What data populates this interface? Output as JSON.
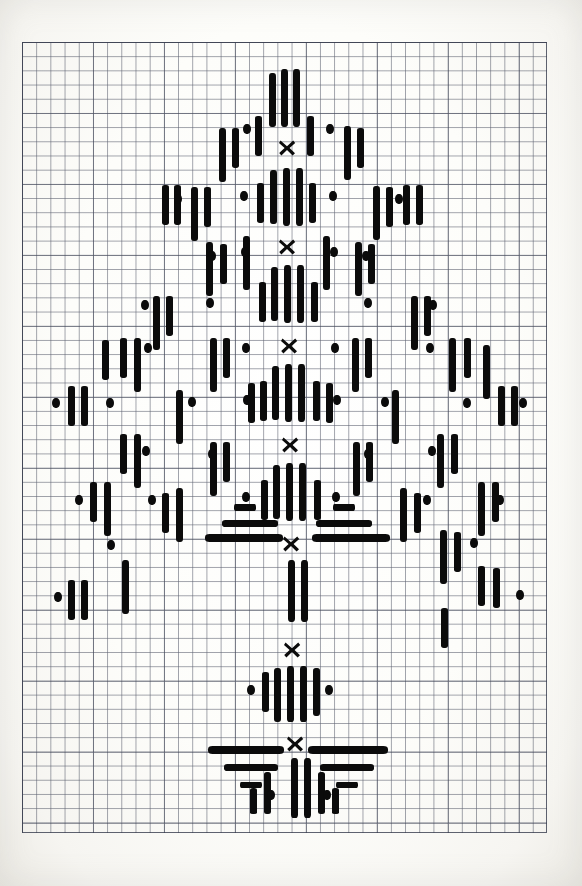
{
  "document": {
    "kind": "hand-drawn needlework chart",
    "title": "Conifer / Christmas tree cross-stitch chart",
    "medium": "ink on graph paper",
    "background_color": "#fdfdfb",
    "ink_color": "#0b0b0b",
    "grid_line_color": "#464b5c",
    "grid_major_color": "#373c4e"
  },
  "grid": {
    "origin_x": 22,
    "origin_y": 42,
    "cell_px": 14.2,
    "columns": 37,
    "rows": 56,
    "major_every": 5,
    "width_px": 525,
    "height_px": 791,
    "visible": true
  },
  "legend": {
    "symbols": [
      {
        "name": "long-vertical-stitch",
        "glyph": "|||",
        "cells": 3,
        "orientation": "vertical"
      },
      {
        "name": "medium-vertical-stitch",
        "glyph": "||",
        "cells": 2,
        "orientation": "vertical"
      },
      {
        "name": "short-vertical-stitch",
        "glyph": "|",
        "cells": 1,
        "orientation": "vertical"
      },
      {
        "name": "dot-stitch",
        "glyph": "•",
        "cells": 0.5,
        "orientation": "point"
      },
      {
        "name": "horizontal-stitch",
        "glyph": "—",
        "orientation": "horizontal"
      },
      {
        "name": "cross-stitch-marker",
        "glyph": "✕",
        "orientation": "cross"
      }
    ]
  },
  "chart_data": {
    "type": "scatter",
    "xlabel": "",
    "ylabel": "",
    "grid": true,
    "legend_position": "none",
    "xlim": [
      0,
      37
    ],
    "ylim": [
      0,
      56
    ],
    "axis_units": "grid cells",
    "center_column": 18.7,
    "crosses": [
      {
        "cx": 287,
        "cy": 148
      },
      {
        "cx": 287,
        "cy": 247
      },
      {
        "cx": 289,
        "cy": 346
      },
      {
        "cx": 290,
        "cy": 445
      },
      {
        "cx": 291,
        "cy": 544
      },
      {
        "cx": 292,
        "cy": 650
      },
      {
        "cx": 295,
        "cy": 744
      }
    ],
    "vertical_bars": [
      {
        "x": 269,
        "y": 73,
        "w": 7,
        "h": 54
      },
      {
        "x": 281,
        "y": 69,
        "w": 7,
        "h": 58
      },
      {
        "x": 293,
        "y": 69,
        "w": 7,
        "h": 58
      },
      {
        "x": 255,
        "y": 116,
        "w": 7,
        "h": 40
      },
      {
        "x": 307,
        "y": 116,
        "w": 7,
        "h": 40
      },
      {
        "x": 219,
        "y": 128,
        "w": 7,
        "h": 54
      },
      {
        "x": 232,
        "y": 128,
        "w": 7,
        "h": 40
      },
      {
        "x": 344,
        "y": 126,
        "w": 7,
        "h": 54
      },
      {
        "x": 357,
        "y": 128,
        "w": 7,
        "h": 40
      },
      {
        "x": 270,
        "y": 170,
        "w": 7,
        "h": 54
      },
      {
        "x": 283,
        "y": 168,
        "w": 7,
        "h": 58
      },
      {
        "x": 296,
        "y": 168,
        "w": 7,
        "h": 58
      },
      {
        "x": 257,
        "y": 183,
        "w": 7,
        "h": 40
      },
      {
        "x": 309,
        "y": 183,
        "w": 7,
        "h": 40
      },
      {
        "x": 191,
        "y": 187,
        "w": 7,
        "h": 54
      },
      {
        "x": 204,
        "y": 187,
        "w": 7,
        "h": 40
      },
      {
        "x": 373,
        "y": 186,
        "w": 7,
        "h": 54
      },
      {
        "x": 386,
        "y": 187,
        "w": 7,
        "h": 40
      },
      {
        "x": 162,
        "y": 185,
        "w": 7,
        "h": 40
      },
      {
        "x": 174,
        "y": 185,
        "w": 7,
        "h": 40
      },
      {
        "x": 403,
        "y": 185,
        "w": 7,
        "h": 40
      },
      {
        "x": 416,
        "y": 185,
        "w": 7,
        "h": 40
      },
      {
        "x": 243,
        "y": 236,
        "w": 7,
        "h": 54
      },
      {
        "x": 323,
        "y": 236,
        "w": 7,
        "h": 54
      },
      {
        "x": 206,
        "y": 242,
        "w": 7,
        "h": 54
      },
      {
        "x": 220,
        "y": 244,
        "w": 7,
        "h": 40
      },
      {
        "x": 355,
        "y": 242,
        "w": 7,
        "h": 54
      },
      {
        "x": 368,
        "y": 244,
        "w": 7,
        "h": 40
      },
      {
        "x": 271,
        "y": 267,
        "w": 7,
        "h": 54
      },
      {
        "x": 284,
        "y": 265,
        "w": 7,
        "h": 58
      },
      {
        "x": 297,
        "y": 265,
        "w": 7,
        "h": 58
      },
      {
        "x": 259,
        "y": 282,
        "w": 7,
        "h": 40
      },
      {
        "x": 311,
        "y": 282,
        "w": 7,
        "h": 40
      },
      {
        "x": 153,
        "y": 296,
        "w": 7,
        "h": 54
      },
      {
        "x": 166,
        "y": 296,
        "w": 7,
        "h": 40
      },
      {
        "x": 411,
        "y": 296,
        "w": 7,
        "h": 54
      },
      {
        "x": 424,
        "y": 296,
        "w": 7,
        "h": 40
      },
      {
        "x": 120,
        "y": 338,
        "w": 7,
        "h": 40
      },
      {
        "x": 134,
        "y": 338,
        "w": 7,
        "h": 54
      },
      {
        "x": 102,
        "y": 340,
        "w": 7,
        "h": 40
      },
      {
        "x": 449,
        "y": 338,
        "w": 7,
        "h": 54
      },
      {
        "x": 464,
        "y": 338,
        "w": 7,
        "h": 40
      },
      {
        "x": 483,
        "y": 345,
        "w": 7,
        "h": 54
      },
      {
        "x": 210,
        "y": 338,
        "w": 7,
        "h": 54
      },
      {
        "x": 223,
        "y": 338,
        "w": 7,
        "h": 40
      },
      {
        "x": 352,
        "y": 338,
        "w": 7,
        "h": 54
      },
      {
        "x": 365,
        "y": 338,
        "w": 7,
        "h": 40
      },
      {
        "x": 272,
        "y": 366,
        "w": 7,
        "h": 54
      },
      {
        "x": 285,
        "y": 364,
        "w": 7,
        "h": 58
      },
      {
        "x": 298,
        "y": 364,
        "w": 7,
        "h": 58
      },
      {
        "x": 260,
        "y": 381,
        "w": 7,
        "h": 40
      },
      {
        "x": 313,
        "y": 381,
        "w": 7,
        "h": 40
      },
      {
        "x": 248,
        "y": 383,
        "w": 7,
        "h": 40
      },
      {
        "x": 326,
        "y": 383,
        "w": 7,
        "h": 40
      },
      {
        "x": 68,
        "y": 386,
        "w": 7,
        "h": 40
      },
      {
        "x": 81,
        "y": 386,
        "w": 7,
        "h": 40
      },
      {
        "x": 498,
        "y": 386,
        "w": 7,
        "h": 40
      },
      {
        "x": 511,
        "y": 386,
        "w": 7,
        "h": 40
      },
      {
        "x": 176,
        "y": 390,
        "w": 7,
        "h": 54
      },
      {
        "x": 392,
        "y": 390,
        "w": 7,
        "h": 54
      },
      {
        "x": 120,
        "y": 434,
        "w": 7,
        "h": 40
      },
      {
        "x": 134,
        "y": 434,
        "w": 7,
        "h": 54
      },
      {
        "x": 437,
        "y": 434,
        "w": 7,
        "h": 54
      },
      {
        "x": 451,
        "y": 434,
        "w": 7,
        "h": 40
      },
      {
        "x": 210,
        "y": 442,
        "w": 7,
        "h": 54
      },
      {
        "x": 223,
        "y": 442,
        "w": 7,
        "h": 40
      },
      {
        "x": 353,
        "y": 442,
        "w": 7,
        "h": 54
      },
      {
        "x": 366,
        "y": 442,
        "w": 7,
        "h": 40
      },
      {
        "x": 273,
        "y": 465,
        "w": 7,
        "h": 54
      },
      {
        "x": 286,
        "y": 463,
        "w": 7,
        "h": 58
      },
      {
        "x": 299,
        "y": 463,
        "w": 7,
        "h": 58
      },
      {
        "x": 261,
        "y": 480,
        "w": 7,
        "h": 40
      },
      {
        "x": 314,
        "y": 480,
        "w": 7,
        "h": 40
      },
      {
        "x": 90,
        "y": 482,
        "w": 7,
        "h": 40
      },
      {
        "x": 104,
        "y": 482,
        "w": 7,
        "h": 54
      },
      {
        "x": 478,
        "y": 482,
        "w": 7,
        "h": 54
      },
      {
        "x": 492,
        "y": 482,
        "w": 7,
        "h": 40
      },
      {
        "x": 176,
        "y": 488,
        "w": 7,
        "h": 54
      },
      {
        "x": 162,
        "y": 493,
        "w": 7,
        "h": 40
      },
      {
        "x": 400,
        "y": 488,
        "w": 7,
        "h": 54
      },
      {
        "x": 414,
        "y": 493,
        "w": 7,
        "h": 40
      },
      {
        "x": 440,
        "y": 530,
        "w": 7,
        "h": 54
      },
      {
        "x": 454,
        "y": 532,
        "w": 7,
        "h": 40
      },
      {
        "x": 288,
        "y": 560,
        "w": 7,
        "h": 62
      },
      {
        "x": 301,
        "y": 560,
        "w": 7,
        "h": 62
      },
      {
        "x": 68,
        "y": 580,
        "w": 7,
        "h": 40
      },
      {
        "x": 81,
        "y": 580,
        "w": 7,
        "h": 40
      },
      {
        "x": 478,
        "y": 566,
        "w": 7,
        "h": 40
      },
      {
        "x": 493,
        "y": 568,
        "w": 7,
        "h": 40
      },
      {
        "x": 122,
        "y": 560,
        "w": 7,
        "h": 54
      },
      {
        "x": 441,
        "y": 608,
        "w": 7,
        "h": 40
      },
      {
        "x": 262,
        "y": 672,
        "w": 7,
        "h": 40
      },
      {
        "x": 274,
        "y": 668,
        "w": 7,
        "h": 54
      },
      {
        "x": 287,
        "y": 666,
        "w": 7,
        "h": 56
      },
      {
        "x": 300,
        "y": 666,
        "w": 7,
        "h": 56
      },
      {
        "x": 313,
        "y": 668,
        "w": 7,
        "h": 48
      },
      {
        "x": 291,
        "y": 758,
        "w": 7,
        "h": 60
      },
      {
        "x": 304,
        "y": 758,
        "w": 7,
        "h": 60
      },
      {
        "x": 264,
        "y": 772,
        "w": 7,
        "h": 42
      },
      {
        "x": 318,
        "y": 772,
        "w": 7,
        "h": 42
      },
      {
        "x": 250,
        "y": 788,
        "w": 7,
        "h": 26
      },
      {
        "x": 332,
        "y": 788,
        "w": 7,
        "h": 26
      }
    ],
    "horizontal_bars": [
      {
        "x": 222,
        "y": 520,
        "w": 56,
        "h": 7
      },
      {
        "x": 316,
        "y": 520,
        "w": 56,
        "h": 7
      },
      {
        "x": 205,
        "y": 534,
        "w": 78,
        "h": 8
      },
      {
        "x": 312,
        "y": 534,
        "w": 78,
        "h": 8
      },
      {
        "x": 234,
        "y": 504,
        "w": 22,
        "h": 7
      },
      {
        "x": 333,
        "y": 504,
        "w": 22,
        "h": 7
      },
      {
        "x": 208,
        "y": 746,
        "w": 76,
        "h": 8
      },
      {
        "x": 308,
        "y": 746,
        "w": 80,
        "h": 8
      },
      {
        "x": 224,
        "y": 764,
        "w": 54,
        "h": 7
      },
      {
        "x": 320,
        "y": 764,
        "w": 54,
        "h": 7
      },
      {
        "x": 240,
        "y": 782,
        "w": 22,
        "h": 6
      },
      {
        "x": 336,
        "y": 782,
        "w": 22,
        "h": 6
      }
    ],
    "dots": [
      {
        "cx": 330,
        "cy": 129,
        "r": 4
      },
      {
        "cx": 247,
        "cy": 129,
        "r": 4
      },
      {
        "cx": 290,
        "cy": 247,
        "r": 0
      },
      {
        "cx": 333,
        "cy": 196,
        "r": 4
      },
      {
        "cx": 244,
        "cy": 196,
        "r": 4
      },
      {
        "cx": 178,
        "cy": 199,
        "r": 4
      },
      {
        "cx": 399,
        "cy": 199,
        "r": 4
      },
      {
        "cx": 334,
        "cy": 252,
        "r": 4
      },
      {
        "cx": 245,
        "cy": 252,
        "r": 4
      },
      {
        "cx": 212,
        "cy": 256,
        "r": 4
      },
      {
        "cx": 366,
        "cy": 256,
        "r": 4
      },
      {
        "cx": 210,
        "cy": 303,
        "r": 4
      },
      {
        "cx": 368,
        "cy": 303,
        "r": 4
      },
      {
        "cx": 145,
        "cy": 305,
        "r": 4
      },
      {
        "cx": 433,
        "cy": 305,
        "r": 4
      },
      {
        "cx": 335,
        "cy": 348,
        "r": 4
      },
      {
        "cx": 246,
        "cy": 348,
        "r": 4
      },
      {
        "cx": 148,
        "cy": 348,
        "r": 4
      },
      {
        "cx": 430,
        "cy": 348,
        "r": 4
      },
      {
        "cx": 56,
        "cy": 403,
        "r": 4
      },
      {
        "cx": 523,
        "cy": 403,
        "r": 4
      },
      {
        "cx": 192,
        "cy": 402,
        "r": 4
      },
      {
        "cx": 385,
        "cy": 402,
        "r": 4
      },
      {
        "cx": 337,
        "cy": 400,
        "r": 4
      },
      {
        "cx": 247,
        "cy": 400,
        "r": 4
      },
      {
        "cx": 110,
        "cy": 403,
        "r": 4
      },
      {
        "cx": 467,
        "cy": 403,
        "r": 4
      },
      {
        "cx": 146,
        "cy": 451,
        "r": 4
      },
      {
        "cx": 432,
        "cy": 451,
        "r": 4
      },
      {
        "cx": 212,
        "cy": 454,
        "r": 4
      },
      {
        "cx": 368,
        "cy": 454,
        "r": 4
      },
      {
        "cx": 336,
        "cy": 497,
        "r": 4
      },
      {
        "cx": 246,
        "cy": 497,
        "r": 4
      },
      {
        "cx": 79,
        "cy": 500,
        "r": 4
      },
      {
        "cx": 500,
        "cy": 500,
        "r": 4
      },
      {
        "cx": 152,
        "cy": 500,
        "r": 4
      },
      {
        "cx": 427,
        "cy": 500,
        "r": 4
      },
      {
        "cx": 474,
        "cy": 543,
        "r": 4
      },
      {
        "cx": 111,
        "cy": 545,
        "r": 4
      },
      {
        "cx": 58,
        "cy": 597,
        "r": 4
      },
      {
        "cx": 520,
        "cy": 595,
        "r": 4
      },
      {
        "cx": 251,
        "cy": 690,
        "r": 4
      },
      {
        "cx": 329,
        "cy": 690,
        "r": 4
      },
      {
        "cx": 271,
        "cy": 795,
        "r": 4
      },
      {
        "cx": 327,
        "cy": 795,
        "r": 4
      }
    ]
  }
}
